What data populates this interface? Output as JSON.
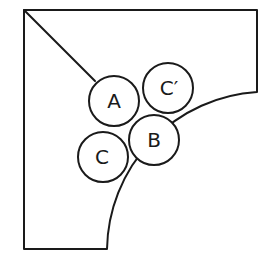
{
  "diagram": {
    "labels": {
      "a": "A",
      "b": "B",
      "c": "C",
      "c_prime": "C′"
    },
    "colors": {
      "stroke": "#1a1a1a",
      "background": "#ffffff"
    }
  }
}
